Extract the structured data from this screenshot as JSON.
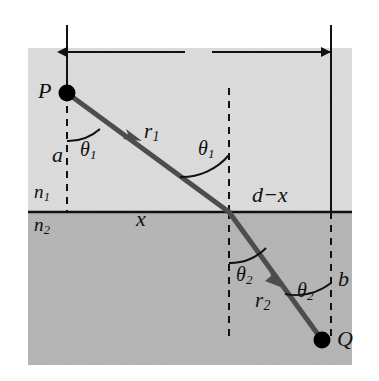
{
  "figure": {
    "canvas": {
      "width": 379,
      "height": 381
    },
    "colors": {
      "medium1_fill": "#dcdcdc",
      "medium2_fill": "#b4b4b4",
      "ray_stroke": "#4d4d4d",
      "line_stroke": "#111111",
      "point_fill": "#000000",
      "background": "#ffffff"
    },
    "regions": [
      {
        "name": "medium-1",
        "index_label": "n1",
        "shade": "light"
      },
      {
        "name": "medium-2",
        "index_label": "n2",
        "shade": "dark"
      }
    ]
  },
  "points": {
    "source": {
      "label": "P",
      "x": 67,
      "y": 93
    },
    "target": {
      "label": "Q",
      "x": 322,
      "y": 340
    },
    "interface_crossing": {
      "x": 229,
      "y": 212
    }
  },
  "labels": {
    "source_point": "P",
    "target_point": "Q",
    "index_medium_1": "n",
    "index_medium_1_sub": "1",
    "index_medium_2": "n",
    "index_medium_2_sub": "2",
    "distance_total": "d",
    "distance_x": "x",
    "distance_d_minus_x": "d−x",
    "height_a": "a",
    "height_b": "b",
    "ray_1": "r",
    "ray_1_sub": "1",
    "ray_2": "r",
    "ray_2_sub": "2",
    "theta_symbol": "θ",
    "theta_1_sub": "1",
    "theta_2_sub": "2"
  },
  "angles": [
    {
      "name": "theta-1-at-source",
      "symbol": "θ",
      "subscript": "1",
      "medium": "n1"
    },
    {
      "name": "theta-1-at-interface",
      "symbol": "θ",
      "subscript": "1",
      "medium": "n1"
    },
    {
      "name": "theta-2-at-interface",
      "symbol": "θ",
      "subscript": "2",
      "medium": "n2"
    },
    {
      "name": "theta-2-at-target",
      "symbol": "θ",
      "subscript": "2",
      "medium": "n2"
    }
  ],
  "dimension_line": {
    "name": "total-horizontal-distance",
    "label": "d",
    "from_x": 67,
    "to_x": 331,
    "y": 52,
    "arrowheads": "both"
  }
}
